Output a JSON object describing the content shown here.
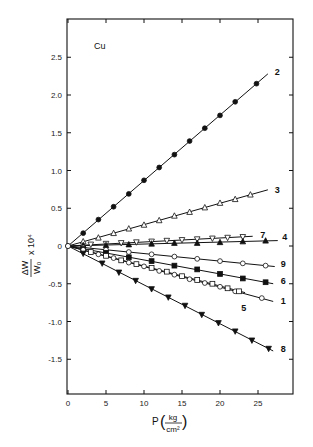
{
  "chart_data": {
    "type": "line",
    "title": "",
    "annotation": "Cu",
    "xlabel": "P(kg/cm²)",
    "xlabel_parts": {
      "var": "P",
      "num": "kg",
      "den": "cm²"
    },
    "ylabel": "ΔW/W₀ × 10⁴",
    "ylabel_parts": {
      "num": "ΔW",
      "den": "W₀",
      "suffix": "x 10⁴"
    },
    "xlim": [
      0,
      29.6
    ],
    "ylim": [
      -2.0,
      3.0
    ],
    "xticks": [
      0,
      5,
      10,
      15,
      20,
      25
    ],
    "xtick_labels": [
      "0",
      "5",
      "10",
      "15",
      "20",
      "25"
    ],
    "yticks": [
      2.5,
      2.0,
      1.5,
      1.0,
      0.5,
      0,
      -0.5,
      -1.0,
      -1.5
    ],
    "ytick_labels": [
      "2.5",
      "2.0",
      "1.5",
      "1.0",
      "0.5",
      "0",
      "-0.5",
      "-1.0",
      "-1.5"
    ],
    "grid": false,
    "legend": "inline labels at line ends",
    "series": [
      {
        "name": "2",
        "marker": "filled-circle",
        "slope": 0.0867,
        "x_end": 26.3,
        "x": [
          2,
          4,
          6,
          8,
          10,
          12,
          14,
          16,
          18,
          20,
          22,
          24.8
        ],
        "values": [
          0.17,
          0.35,
          0.52,
          0.69,
          0.87,
          1.04,
          1.21,
          1.39,
          1.56,
          1.73,
          1.91,
          2.15
        ]
      },
      {
        "name": "3",
        "marker": "open-triangle-up",
        "slope": 0.0283,
        "x_end": 26.3,
        "x": [
          2,
          4,
          6,
          8,
          10,
          12,
          14,
          16,
          18,
          20,
          22,
          24
        ],
        "values": [
          0.06,
          0.11,
          0.17,
          0.23,
          0.28,
          0.34,
          0.4,
          0.45,
          0.51,
          0.57,
          0.62,
          0.68
        ]
      },
      {
        "name": "7",
        "marker": "open-triangle-down",
        "slope": 0.0053,
        "x_end": 24.3,
        "x": [
          3,
          5,
          7,
          9,
          11,
          13,
          15,
          17,
          19,
          21,
          23
        ],
        "values": [
          0.02,
          0.03,
          0.04,
          0.05,
          0.06,
          0.07,
          0.08,
          0.09,
          0.1,
          0.11,
          0.12
        ]
      },
      {
        "name": "4",
        "marker": "filled-triangle-up",
        "slope": 0.0026,
        "x_end": 27.6,
        "x": [
          2,
          5,
          8,
          11,
          14,
          17,
          20,
          23,
          26
        ],
        "values": [
          0.01,
          0.01,
          0.02,
          0.03,
          0.04,
          0.04,
          0.05,
          0.06,
          0.07
        ]
      },
      {
        "name": "9",
        "marker": "open-circle",
        "slope": -0.01,
        "x_end": 27.2,
        "x": [
          2,
          5,
          8,
          11,
          14,
          17,
          20,
          23,
          26
        ],
        "values": [
          -0.02,
          -0.05,
          -0.08,
          -0.11,
          -0.14,
          -0.17,
          -0.2,
          -0.23,
          -0.26
        ]
      },
      {
        "name": "6",
        "marker": "filled-square",
        "slope": -0.0185,
        "x_end": 27.0,
        "x": [
          2,
          5,
          8,
          11,
          14,
          17,
          20,
          23,
          26
        ],
        "values": [
          -0.04,
          -0.09,
          -0.15,
          -0.2,
          -0.26,
          -0.31,
          -0.37,
          -0.43,
          -0.48
        ]
      },
      {
        "name": "1",
        "marker": "open-circle",
        "slope": -0.0272,
        "x_end": 27.0,
        "x": [
          2,
          4,
          6,
          8,
          10,
          12,
          14,
          16,
          18,
          20,
          22,
          25.5
        ],
        "values": [
          -0.05,
          -0.11,
          -0.16,
          -0.22,
          -0.27,
          -0.33,
          -0.38,
          -0.44,
          -0.49,
          -0.54,
          -0.6,
          -0.69
        ]
      },
      {
        "name": "5",
        "marker": "open-square",
        "slope": -0.0265,
        "x_end": 23.3,
        "x": [
          3,
          5,
          7,
          9,
          11,
          13,
          15,
          17,
          19,
          21,
          22.5
        ],
        "values": [
          -0.08,
          -0.13,
          -0.19,
          -0.24,
          -0.29,
          -0.34,
          -0.4,
          -0.45,
          -0.5,
          -0.56,
          -0.6
        ]
      },
      {
        "name": "8",
        "marker": "filled-triangle-down",
        "slope": -0.0515,
        "x_end": 27.0,
        "x": [
          2,
          4.5,
          6.7,
          8.9,
          11,
          13.2,
          15.4,
          17.6,
          19.8,
          22,
          24.2,
          26.4
        ],
        "values": [
          -0.1,
          -0.23,
          -0.35,
          -0.46,
          -0.57,
          -0.68,
          -0.79,
          -0.91,
          -1.02,
          -1.13,
          -1.25,
          -1.36
        ]
      }
    ],
    "label_positions": {
      "2": [
        27.2,
        2.3
      ],
      "3": [
        27.2,
        0.74
      ],
      "7": [
        25.3,
        0.15
      ],
      "4": [
        28.2,
        0.12
      ],
      "9": [
        28.0,
        -0.24
      ],
      "6": [
        28.0,
        -0.47
      ],
      "1": [
        28.0,
        -0.73
      ],
      "5": [
        22.8,
        -0.82
      ],
      "8": [
        28.0,
        -1.36
      ]
    }
  },
  "colors": {
    "ink": "#111111",
    "background": "#ffffff"
  }
}
